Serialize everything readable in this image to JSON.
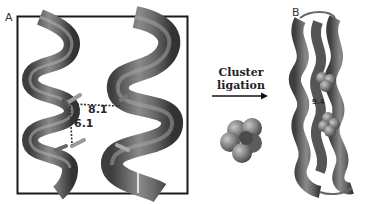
{
  "figure": {
    "panel_a": {
      "label": "A",
      "distances": [
        {
          "value": "8.1",
          "kind": "horizontal"
        },
        {
          "value": "6.1",
          "kind": "vertical"
        }
      ]
    },
    "transition": {
      "line1": "Cluster",
      "line2": "ligation"
    },
    "panel_b": {
      "label": "B",
      "distances": [
        {
          "value": "9.4"
        }
      ]
    },
    "colors": {
      "helix_dark": "#4a4a4a",
      "helix_mid": "#6e6e6e",
      "helix_light": "#9a9a9a",
      "box": "#1a1a1a"
    }
  }
}
